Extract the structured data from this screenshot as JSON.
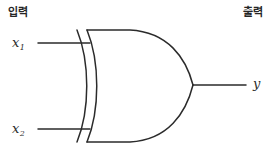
{
  "diagram": {
    "type": "logic-gate-schematic",
    "gate": "XOR",
    "stroke_color": "#2b2b2b",
    "fill_color": "#ffffff",
    "background_color": "#ffffff",
    "width": 279,
    "height": 157
  },
  "labels": {
    "input_section": "입력",
    "output_section": "출력",
    "input_1_base": "x",
    "input_1_sub": "1",
    "input_2_base": "x",
    "input_2_sub": "2",
    "output": "y"
  }
}
